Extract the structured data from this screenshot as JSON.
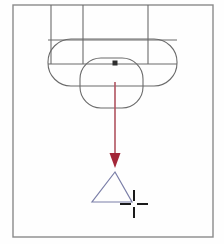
{
  "app": {
    "title": "CAD Drawing Canvas",
    "canvas_width": 224,
    "canvas_height": 244,
    "background_color": "#fefefe"
  },
  "colors": {
    "geometry_stroke": "#6b6b6b",
    "frame_stroke": "#8a8a8a",
    "arrow": "#a32638",
    "arrow_tail": "#b05360",
    "triangle_stroke": "#7b7fa8",
    "snap_marker": "#2e2e2e",
    "crosshair": "#1a1a1a"
  },
  "frame": {
    "label": "drawing-border",
    "x": 13,
    "y": 5,
    "width": 200,
    "height": 232,
    "stroke_width": 1.4
  },
  "shapes": {
    "vertical_lines": [
      {
        "name": "construction-line-left",
        "x": 51,
        "y1": 5,
        "y2": 64
      },
      {
        "name": "construction-line-mid",
        "x": 83,
        "y1": 5,
        "y2": 64
      },
      {
        "name": "construction-line-right",
        "x": 148,
        "y1": 5,
        "y2": 64
      }
    ],
    "horizontal_lines": [
      {
        "name": "datum-line-upper",
        "y": 40,
        "x1": 48,
        "x2": 177
      },
      {
        "name": "datum-line-lower",
        "y": 64,
        "x1": 48,
        "x2": 177
      }
    ],
    "rounded_rectangles": [
      {
        "name": "slot-outline-upper",
        "x": 48,
        "y": 39,
        "width": 129,
        "height": 47,
        "radius": 23
      },
      {
        "name": "slot-outline-lower",
        "x": 80,
        "y": 58,
        "width": 63,
        "height": 50,
        "radius": 21
      }
    ],
    "snap_marker": {
      "name": "snap-point-marker",
      "x": 115,
      "y": 63,
      "size": 5
    },
    "triangle": {
      "name": "triangle-object",
      "apex_x": 115,
      "apex_y": 172,
      "left_x": 92,
      "left_y": 202,
      "right_x": 132,
      "right_y": 202,
      "stroke_width": 1.2
    },
    "crosshair": {
      "name": "cursor-crosshair",
      "center_x": 134,
      "center_y": 204,
      "arm_length": 11,
      "gap": 3,
      "stroke_width": 2
    }
  },
  "arrow": {
    "name": "drag-direction-arrow",
    "start_x": 115,
    "start_y": 82,
    "end_x": 115,
    "end_y": 168,
    "head_width": 11,
    "head_length": 15,
    "shaft_width": 1.6
  }
}
